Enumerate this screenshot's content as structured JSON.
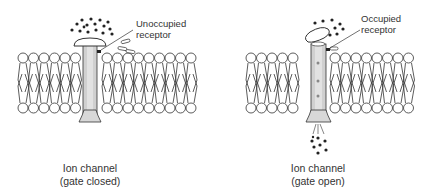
{
  "panels": [
    {
      "id": "closed",
      "receptor_label": [
        "Unoccupied",
        "receptor"
      ],
      "caption": [
        "Ion channel",
        "(gate closed)"
      ],
      "state": "closed"
    },
    {
      "id": "open",
      "receptor_label": [
        "Occupied",
        "receptor"
      ],
      "caption": [
        "Ion channel",
        "(gate open)"
      ],
      "state": "open"
    }
  ],
  "colors": {
    "line": "#333333",
    "channel_fill": "#c8c8c8",
    "channel_core": "#e6e6e6",
    "ion": "#222222"
  }
}
